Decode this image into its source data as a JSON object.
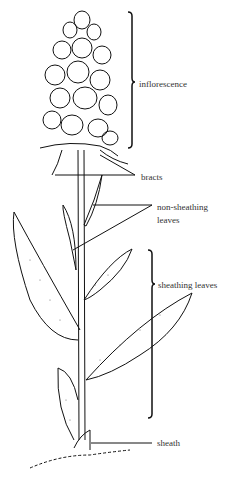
{
  "diagram": {
    "labels": {
      "inflorescence": "inflorescence",
      "bracts": "bracts",
      "non_sheathing_leaves_line1": "non-sheathing",
      "non_sheathing_leaves_line2": "leaves",
      "sheathing_leaves": "sheathing leaves",
      "sheath": "sheath"
    },
    "colors": {
      "ink": "#111111",
      "text": "#333333",
      "background": "#ffffff"
    }
  }
}
